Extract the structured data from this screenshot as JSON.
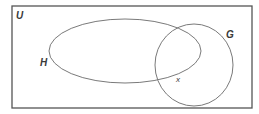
{
  "diagram": {
    "type": "venn",
    "universal_set": {
      "label": "U",
      "rect": {
        "x": 12,
        "y": 6,
        "width": 240,
        "height": 102
      }
    },
    "sets": [
      {
        "name": "H",
        "label": "H",
        "shape": "ellipse",
        "cx": 125,
        "cy": 51,
        "rx": 76,
        "ry": 32,
        "label_pos": {
          "x": 40,
          "y": 66
        }
      },
      {
        "name": "G",
        "label": "G",
        "shape": "circle",
        "cx": 194,
        "cy": 65,
        "rx": 39,
        "ry": 41,
        "label_pos": {
          "x": 226,
          "y": 38
        }
      }
    ],
    "elements": [
      {
        "label": "x",
        "region": "H ∩ G",
        "pos": {
          "x": 176,
          "y": 82
        }
      }
    ],
    "colors": {
      "stroke": "#7a7a7a",
      "border": "#555555",
      "text": "#3a3a3a"
    }
  }
}
